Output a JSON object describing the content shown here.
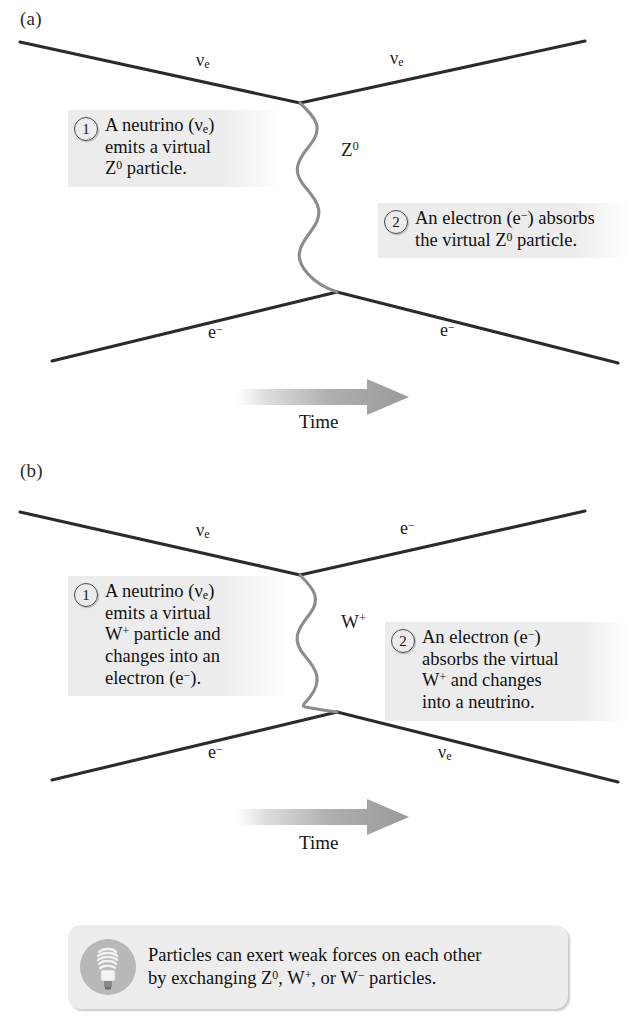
{
  "figure": {
    "type": "feynman-diagram-pair",
    "background": "#ffffff",
    "line_color": "#2b2b2b",
    "boson_color": "#8c8c8c",
    "callout_bg": "#ededed",
    "arrow_color": "#9a9a9a"
  },
  "panels": [
    {
      "id": "a",
      "label": "(a)",
      "interaction": "neutral current",
      "boson": "Z0",
      "incoming_top": "ν",
      "incoming_top_sub": "e",
      "outgoing_top": "ν",
      "outgoing_top_sub": "e",
      "incoming_bottom": "e",
      "incoming_bottom_sup": "−",
      "outgoing_bottom": "e",
      "outgoing_bottom_sup": "−",
      "boson_label_base": "Z",
      "boson_label_sup": "0",
      "time_label": "Time",
      "callouts": [
        {
          "number": "1",
          "line1_a": "A neutrino (",
          "line1_nu": "ν",
          "line1_sub": "e",
          "line1_b": ")",
          "line2": "emits a virtual",
          "line3_a": "Z",
          "line3_sup": "0",
          "line3_b": " particle."
        },
        {
          "number": "2",
          "line1_a": "An electron (e",
          "line1_sup": "−",
          "line1_b": ") absorbs",
          "line2_a": "the virtual Z",
          "line2_sup": "0",
          "line2_b": " particle."
        }
      ]
    },
    {
      "id": "b",
      "label": "(b)",
      "interaction": "charged current",
      "boson": "W+",
      "incoming_top": "ν",
      "incoming_top_sub": "e",
      "outgoing_top": "e",
      "outgoing_top_sup": "−",
      "incoming_bottom": "e",
      "incoming_bottom_sup": "−",
      "outgoing_bottom": "ν",
      "outgoing_bottom_sub": "e",
      "boson_label_base": "W",
      "boson_label_sup": "+",
      "time_label": "Time",
      "callouts": [
        {
          "number": "1",
          "line1_a": "A neutrino (",
          "line1_nu": "ν",
          "line1_sub": "e",
          "line1_b": ")",
          "line2": "emits a virtual",
          "line3_a": "W",
          "line3_sup": "+",
          "line3_b": " particle and",
          "line4": "changes into an",
          "line5_a": "electron (e",
          "line5_sup": "−",
          "line5_b": ")."
        },
        {
          "number": "2",
          "line1_a": "An electron (e",
          "line1_sup": "−",
          "line1_b": ")",
          "line2": "absorbs the virtual",
          "line3_a": "W",
          "line3_sup": "+",
          "line3_b": " and changes",
          "line4": "into a neutrino."
        }
      ]
    }
  ],
  "footer": {
    "icon": "lightbulb-icon",
    "line1": "Particles can exert weak forces on each other",
    "line2_a": "by exchanging Z",
    "line2_sup1": "0",
    "line2_b": ", W",
    "line2_sup2": "+",
    "line2_c": ", or W",
    "line2_sup3": "−",
    "line2_d": " particles."
  }
}
